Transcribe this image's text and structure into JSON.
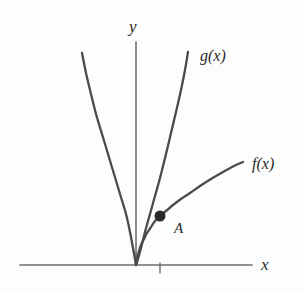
{
  "figure": {
    "title": "",
    "background_color": "#fdfdfd",
    "stroke_color": "#4a4a4a",
    "axis_color": "#6a6a6a",
    "text_color": "#2a2a2a"
  },
  "labels": {
    "y_axis": "y",
    "x_axis": "x",
    "curve_g": "g(x)",
    "curve_f": "f(x)",
    "point_a": "A"
  },
  "chart_data": {
    "type": "line",
    "title": "",
    "xlabel": "x",
    "ylabel": "y",
    "grid": false,
    "legend_position": "inline-curve-end",
    "axes": {
      "origin_px": [
        136,
        265
      ],
      "x_axis_px": {
        "x1": 20,
        "y1": 265,
        "x2": 252,
        "y2": 265
      },
      "y_axis_px": {
        "x1": 136,
        "y1": 42,
        "x2": 136,
        "y2": 265
      },
      "x_tick_px": [
        160
      ],
      "x_tick_labels": [
        ""
      ],
      "y_tick_px": [],
      "y_tick_labels": []
    },
    "series": [
      {
        "name": "g(x)",
        "label": "g(x)",
        "shape": "parabola",
        "description": "upward parabola with vertex at the origin, steep branches",
        "color": "#4a4a4a",
        "points_px": [
          [
            82,
            53
          ],
          [
            86,
            73
          ],
          [
            91,
            94
          ],
          [
            96,
            114
          ],
          [
            102,
            134
          ],
          [
            108,
            154
          ],
          [
            114,
            174
          ],
          [
            120,
            194
          ],
          [
            126,
            214
          ],
          [
            130,
            232
          ],
          [
            133,
            248
          ],
          [
            135,
            259
          ],
          [
            136,
            265
          ],
          [
            138,
            259
          ],
          [
            141,
            248
          ],
          [
            145,
            232
          ],
          [
            150,
            214
          ],
          [
            155,
            196
          ],
          [
            160,
            178
          ],
          [
            166,
            154
          ],
          [
            171,
            133
          ],
          [
            176,
            112
          ],
          [
            181,
            90
          ],
          [
            185,
            70
          ],
          [
            188,
            52
          ]
        ]
      },
      {
        "name": "f(x)",
        "label": "f(x)",
        "shape": "square-root",
        "description": "concave-down increasing curve from the origin, like a square root",
        "color": "#4a4a4a",
        "points_px": [
          [
            136,
            265
          ],
          [
            137,
            258
          ],
          [
            139,
            251
          ],
          [
            141,
            245
          ],
          [
            144,
            239
          ],
          [
            147,
            233
          ],
          [
            151,
            227
          ],
          [
            155,
            221
          ],
          [
            160,
            216
          ],
          [
            166,
            211
          ],
          [
            173,
            205
          ],
          [
            181,
            199
          ],
          [
            190,
            193
          ],
          [
            200,
            186
          ],
          [
            211,
            179
          ],
          [
            223,
            172
          ],
          [
            234,
            166
          ],
          [
            243,
            162
          ]
        ]
      }
    ],
    "annotations": [
      {
        "name": "A",
        "label": "A",
        "type": "intersection-point",
        "marker": "filled-circle",
        "position_px": [
          160,
          216
        ],
        "radius_px": 5.5,
        "color": "#2a2a2a",
        "label_offset_px": [
          14,
          5
        ]
      }
    ]
  }
}
